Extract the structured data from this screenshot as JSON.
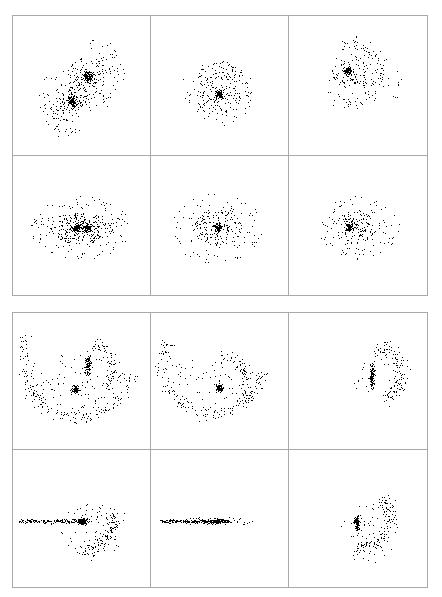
{
  "figure": {
    "title": "",
    "background_color": "#ffffff",
    "point_color": "#000000",
    "frame_color": "#a9a9a9",
    "blocks": [
      {
        "name": "upper-block",
        "label": "Upper panel block"
      },
      {
        "name": "lower-block",
        "label": "Lower panel block"
      }
    ]
  },
  "chart_data": {
    "type": "scatter",
    "title": "",
    "subtitle": "",
    "xlabel": "",
    "ylabel": "",
    "grid": false,
    "legend": null,
    "axis_ticks": [],
    "tick_labels": [],
    "layout": {
      "blocks": 2,
      "rows_per_block": 2,
      "cols_per_block": 3,
      "panel_count": 12,
      "xlim": [
        0,
        1
      ],
      "ylim": [
        0,
        1
      ],
      "marker": "square",
      "marker_size_px": 1.2,
      "color": "#000000"
    },
    "panels": [
      {
        "id": "p1",
        "name": "upper-row1-col1",
        "block": 0,
        "row": 0,
        "col": 0,
        "description": "Two dense cores on a NE-SW diagonal with broad spiral debris",
        "n_points": 560,
        "components": [
          {
            "kind": "core",
            "cx": 0.545,
            "cy": 0.565,
            "rx": 0.038,
            "ry": 0.04,
            "n": 110,
            "density": 1.0
          },
          {
            "kind": "core",
            "cx": 0.43,
            "cy": 0.385,
            "rx": 0.03,
            "ry": 0.032,
            "n": 80,
            "density": 1.0
          },
          {
            "kind": "halo",
            "cx": 0.545,
            "cy": 0.565,
            "rx": 0.15,
            "ry": 0.15,
            "n": 80,
            "density": 0.5
          },
          {
            "kind": "halo",
            "cx": 0.43,
            "cy": 0.385,
            "rx": 0.15,
            "ry": 0.15,
            "n": 80,
            "density": 0.5
          },
          {
            "kind": "diagonal",
            "cx": 0.49,
            "cy": 0.47,
            "rx": 0.3,
            "ry": 0.115,
            "angle": 42,
            "n": 140,
            "density": 0.35
          },
          {
            "kind": "arc",
            "cx": 0.56,
            "cy": 0.59,
            "r": 0.215,
            "spread": 0.055,
            "a0": -80,
            "a1": 95,
            "n": 40
          },
          {
            "kind": "arc",
            "cx": 0.42,
            "cy": 0.37,
            "r": 0.215,
            "spread": 0.055,
            "a0": 110,
            "a1": 290,
            "n": 30
          }
        ]
      },
      {
        "id": "p2",
        "name": "upper-row1-col2",
        "block": 0,
        "row": 0,
        "col": 1,
        "description": "Single compact core with diffuse spiral-like halo",
        "n_points": 330,
        "components": [
          {
            "kind": "core",
            "cx": 0.5,
            "cy": 0.44,
            "rx": 0.028,
            "ry": 0.03,
            "n": 85,
            "density": 1.0
          },
          {
            "kind": "halo",
            "cx": 0.495,
            "cy": 0.44,
            "rx": 0.175,
            "ry": 0.16,
            "n": 140,
            "density": 0.55
          },
          {
            "kind": "arc",
            "cx": 0.5,
            "cy": 0.445,
            "r": 0.2,
            "spread": 0.06,
            "a0": -30,
            "a1": 250,
            "n": 70
          },
          {
            "kind": "sparse",
            "cx": 0.48,
            "cy": 0.45,
            "rx": 0.27,
            "ry": 0.25,
            "n": 35
          }
        ]
      },
      {
        "id": "p3",
        "name": "upper-row1-col3",
        "block": 0,
        "row": 0,
        "col": 2,
        "description": "Compact core offset up-left with extended one-armed halo to the right",
        "n_points": 300,
        "components": [
          {
            "kind": "core",
            "cx": 0.425,
            "cy": 0.605,
            "rx": 0.028,
            "ry": 0.03,
            "n": 80,
            "density": 1.0
          },
          {
            "kind": "halo",
            "cx": 0.44,
            "cy": 0.59,
            "rx": 0.14,
            "ry": 0.13,
            "n": 90,
            "density": 0.55
          },
          {
            "kind": "arc",
            "cx": 0.44,
            "cy": 0.59,
            "r": 0.215,
            "spread": 0.06,
            "a0": -110,
            "a1": 110,
            "n": 90
          },
          {
            "kind": "sparse",
            "cx": 0.52,
            "cy": 0.54,
            "rx": 0.3,
            "ry": 0.25,
            "n": 40
          }
        ]
      },
      {
        "id": "p4",
        "name": "upper-row2-col1",
        "block": 0,
        "row": 1,
        "col": 0,
        "description": "Two merged cores side by side with wide horizontally flattened envelope",
        "n_points": 560,
        "components": [
          {
            "kind": "core",
            "cx": 0.46,
            "cy": 0.49,
            "rx": 0.032,
            "ry": 0.03,
            "n": 95,
            "density": 1.0
          },
          {
            "kind": "core",
            "cx": 0.535,
            "cy": 0.485,
            "rx": 0.03,
            "ry": 0.03,
            "n": 85,
            "density": 1.0
          },
          {
            "kind": "halo",
            "cx": 0.495,
            "cy": 0.485,
            "rx": 0.23,
            "ry": 0.115,
            "n": 230,
            "density": 0.6
          },
          {
            "kind": "sparse",
            "cx": 0.49,
            "cy": 0.49,
            "rx": 0.37,
            "ry": 0.23,
            "n": 150
          }
        ]
      },
      {
        "id": "p5",
        "name": "upper-row2-col2",
        "block": 0,
        "row": 1,
        "col": 1,
        "description": "Single core with roughly round diffuse halo",
        "n_points": 330,
        "components": [
          {
            "kind": "core",
            "cx": 0.49,
            "cy": 0.49,
            "rx": 0.024,
            "ry": 0.026,
            "n": 80,
            "density": 1.0
          },
          {
            "kind": "halo",
            "cx": 0.485,
            "cy": 0.49,
            "rx": 0.175,
            "ry": 0.13,
            "n": 140,
            "density": 0.6
          },
          {
            "kind": "sparse",
            "cx": 0.48,
            "cy": 0.485,
            "rx": 0.33,
            "ry": 0.26,
            "n": 110
          }
        ]
      },
      {
        "id": "p6",
        "name": "upper-row2-col3",
        "block": 0,
        "row": 1,
        "col": 2,
        "description": "Single core left-of-centre with halo extended to the right",
        "n_points": 300,
        "components": [
          {
            "kind": "core",
            "cx": 0.435,
            "cy": 0.49,
            "rx": 0.026,
            "ry": 0.028,
            "n": 80,
            "density": 1.0
          },
          {
            "kind": "halo",
            "cx": 0.47,
            "cy": 0.49,
            "rx": 0.165,
            "ry": 0.115,
            "n": 115,
            "density": 0.6
          },
          {
            "kind": "sparse",
            "cx": 0.5,
            "cy": 0.485,
            "rx": 0.3,
            "ry": 0.23,
            "n": 105
          }
        ]
      },
      {
        "id": "p7",
        "name": "lower-row1-col1",
        "block": 1,
        "row": 0,
        "col": 0,
        "description": "Large U-shaped tidal arc with two vertically elongated cores near centre-right",
        "n_points": 520,
        "components": [
          {
            "kind": "core",
            "cx": 0.545,
            "cy": 0.61,
            "rx": 0.02,
            "ry": 0.07,
            "n": 110,
            "density": 1.0
          },
          {
            "kind": "core",
            "cx": 0.455,
            "cy": 0.44,
            "rx": 0.028,
            "ry": 0.03,
            "n": 70,
            "density": 1.0
          },
          {
            "kind": "arc",
            "cx": 0.47,
            "cy": 0.64,
            "r": 0.4,
            "spread": 0.055,
            "a0": 150,
            "a1": 350,
            "n": 170
          },
          {
            "kind": "arc",
            "cx": 0.545,
            "cy": 0.6,
            "r": 0.175,
            "spread": 0.05,
            "a0": -50,
            "a1": 80,
            "n": 70
          },
          {
            "kind": "sparse",
            "cx": 0.47,
            "cy": 0.48,
            "rx": 0.39,
            "ry": 0.23,
            "n": 100
          }
        ]
      },
      {
        "id": "p8",
        "name": "lower-row1-col2",
        "block": 1,
        "row": 0,
        "col": 1,
        "description": "U-shaped arc with a single core at its right inner bend",
        "n_points": 380,
        "components": [
          {
            "kind": "core",
            "cx": 0.5,
            "cy": 0.45,
            "rx": 0.024,
            "ry": 0.03,
            "n": 80,
            "density": 1.0
          },
          {
            "kind": "arc",
            "cx": 0.45,
            "cy": 0.64,
            "r": 0.37,
            "spread": 0.055,
            "a0": 155,
            "a1": 350,
            "n": 150
          },
          {
            "kind": "arc",
            "cx": 0.51,
            "cy": 0.47,
            "r": 0.2,
            "spread": 0.055,
            "a0": -30,
            "a1": 90,
            "n": 70
          },
          {
            "kind": "sparse",
            "cx": 0.45,
            "cy": 0.47,
            "rx": 0.37,
            "ry": 0.22,
            "n": 80
          }
        ]
      },
      {
        "id": "p9",
        "name": "lower-row1-col3",
        "block": 1,
        "row": 0,
        "col": 2,
        "description": "Vertical bar-like core right of centre with a C-shaped arc opening left",
        "n_points": 260,
        "components": [
          {
            "kind": "core",
            "cx": 0.6,
            "cy": 0.545,
            "rx": 0.018,
            "ry": 0.08,
            "n": 110,
            "density": 1.0
          },
          {
            "kind": "arc",
            "cx": 0.61,
            "cy": 0.56,
            "r": 0.2,
            "spread": 0.055,
            "a0": -70,
            "a1": 85,
            "n": 110
          },
          {
            "kind": "sparse",
            "cx": 0.66,
            "cy": 0.54,
            "rx": 0.2,
            "ry": 0.2,
            "n": 40
          }
        ]
      },
      {
        "id": "p10",
        "name": "lower-row2-col1",
        "block": 1,
        "row": 1,
        "col": 0,
        "description": "Edge-on horizontal streak with dense core and long trailing arc to lower-right",
        "n_points": 520,
        "components": [
          {
            "kind": "core",
            "cx": 0.51,
            "cy": 0.48,
            "rx": 0.04,
            "ry": 0.022,
            "n": 120,
            "density": 1.0
          },
          {
            "kind": "streak",
            "x0": 0.035,
            "x1": 0.51,
            "cy": 0.482,
            "thick": 0.016,
            "n": 160
          },
          {
            "kind": "arc",
            "cx": 0.47,
            "cy": 0.52,
            "r": 0.265,
            "spread": 0.06,
            "a0": -85,
            "a1": 5,
            "n": 120
          },
          {
            "kind": "sparse",
            "cx": 0.58,
            "cy": 0.42,
            "rx": 0.24,
            "ry": 0.2,
            "n": 70
          }
        ]
      },
      {
        "id": "p11",
        "name": "lower-row2-col2",
        "block": 1,
        "row": 1,
        "col": 1,
        "description": "Edge-on horizontal streak with compact core, almost no vertical extent",
        "n_points": 330,
        "components": [
          {
            "kind": "core",
            "cx": 0.48,
            "cy": 0.48,
            "rx": 0.045,
            "ry": 0.018,
            "n": 110,
            "density": 1.0
          },
          {
            "kind": "streak",
            "x0": 0.045,
            "x1": 0.59,
            "cy": 0.482,
            "thick": 0.014,
            "n": 190
          },
          {
            "kind": "sparse",
            "cx": 0.45,
            "cy": 0.48,
            "rx": 0.32,
            "ry": 0.03,
            "n": 50
          }
        ]
      },
      {
        "id": "p12",
        "name": "lower-row2-col3",
        "block": 1,
        "row": 1,
        "col": 2,
        "description": "Vertical bar core left of centre with sweeping arc to the lower right",
        "n_points": 280,
        "components": [
          {
            "kind": "core",
            "cx": 0.49,
            "cy": 0.47,
            "rx": 0.02,
            "ry": 0.06,
            "n": 100,
            "density": 1.0
          },
          {
            "kind": "arc",
            "cx": 0.5,
            "cy": 0.52,
            "r": 0.23,
            "spread": 0.055,
            "a0": -95,
            "a1": 40,
            "n": 120
          },
          {
            "kind": "sparse",
            "cx": 0.58,
            "cy": 0.4,
            "rx": 0.21,
            "ry": 0.23,
            "n": 55
          }
        ]
      }
    ]
  }
}
